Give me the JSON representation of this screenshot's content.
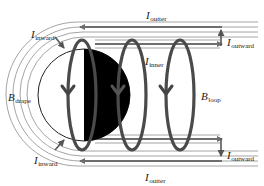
{
  "diagram": {
    "type": "magnetic current sheet / field line schematic",
    "colors": {
      "background": "#ffffff",
      "thin_line": "#9a9a9a",
      "current_line": "#6e6e6e",
      "loop": "#4a4a4a",
      "disk": "#000000",
      "label": "#1a1a1a"
    },
    "labels": {
      "i_outter_top": {
        "main": "I",
        "sub": "outter"
      },
      "i_outter_bottom": {
        "main": "I",
        "sub": "outter"
      },
      "i_outward_top": {
        "main": "I",
        "sub": "outward"
      },
      "i_outward_bottom": {
        "main": "I",
        "sub": "outward"
      },
      "i_inward_top": {
        "main": "I",
        "sub": "inward"
      },
      "i_inward_bottom": {
        "main": "I",
        "sub": "inward"
      },
      "i_inner": {
        "main": "I",
        "sub": "inner"
      },
      "b_drape": {
        "main": "B",
        "sub": "drape"
      },
      "b_loop": {
        "main": "B",
        "sub": "loop"
      }
    },
    "elements": {
      "disk": "half-filled circle (left half white outline, right half black)",
      "loops": 3,
      "loop_arrow_direction": "downward",
      "outer_current_direction": "leftward",
      "inner_current_direction": "rightward",
      "outward_arrows": [
        "up (top)",
        "down (bottom)"
      ],
      "inward_arrows": [
        "toward disk (top-left)",
        "toward disk (bottom-left)"
      ]
    }
  }
}
